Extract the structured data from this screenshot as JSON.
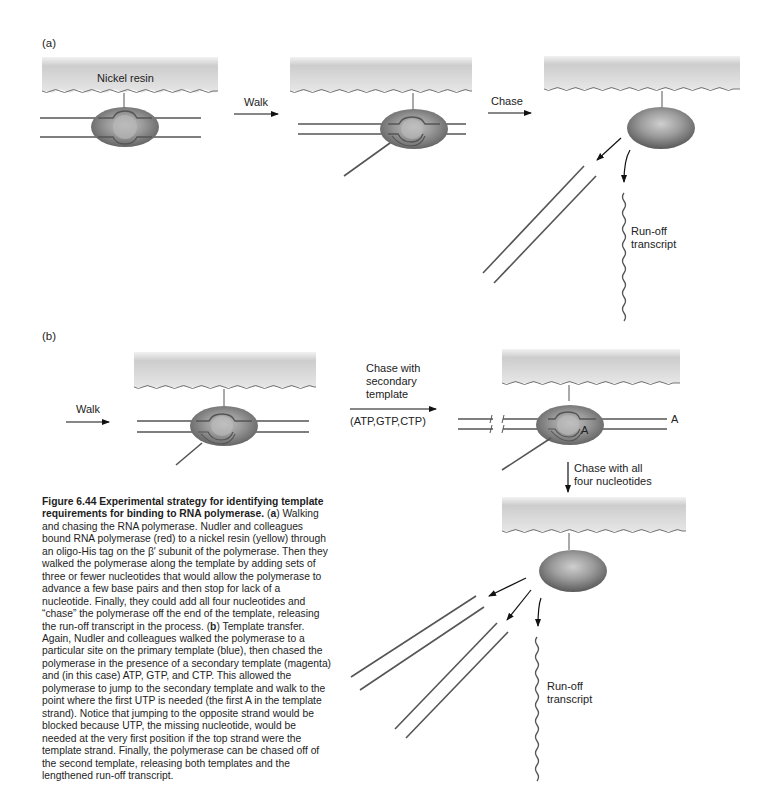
{
  "figure": {
    "panel_a": {
      "label": "(a)",
      "resin_label": "Nickel resin",
      "step1_arrow": "Walk",
      "step2_arrow": "Chase",
      "transcript_label_line1": "Run-off",
      "transcript_label_line2": "transcript"
    },
    "panel_b": {
      "label": "(b)",
      "step1_arrow": "Walk",
      "step2_line1": "Chase with",
      "step2_line2": "secondary",
      "step2_line3": "template",
      "step2_nucleotides": "(ATP,GTP,CTP)",
      "template_end_marker": "A",
      "template_inner_marker": "A",
      "step3_line1": "Chase with all",
      "step3_line2": "four nucleotides",
      "transcript_label_line1": "Run-off",
      "transcript_label_line2": "transcript"
    },
    "colors": {
      "resin_top": "#c9c9c9",
      "resin_bottom": "#ededed",
      "polymerase_outer": "#6e6e6e",
      "polymerase_inner": "#bdbdbd",
      "strand": "#555555"
    }
  },
  "caption": {
    "title": "Figure 6.44    Experimental strategy for identifying template requirements for binding to RNA polymerase.",
    "part_a_marker": "a",
    "part_a_text": " Walking and chasing the RNA polymerase. Nudler and colleagues bound RNA polymerase (red) to a nickel resin (yellow) through an oligo-His tag on the β′ subunit of the polymerase. Then they walked the polymerase along the template by adding sets of three or fewer nucleotides that would allow the polymerase to advance a few base pairs and then stop for lack of a nucleotide. Finally, they could add all four nucleotides and “chase” the polymerase off the end of the template, releasing the run-off transcript in the process. ",
    "part_b_marker": "b",
    "part_b_text": " Template transfer. Again, Nudler and colleagues walked the polymerase to a particular site on the primary template (blue), then chased the polymerase in the presence of a secondary template (magenta) and (in this case) ATP, GTP, and CTP. This allowed the polymerase to jump to the secondary template and walk to the point where the first UTP is needed (the first A in the template strand). Notice that jumping to the opposite strand would be blocked because UTP, the missing nucleotide, would be needed at the very first position if the top strand were the template strand. Finally, the polymerase can be chased off of the second template, releasing both templates and the lengthened run-off transcript."
  }
}
